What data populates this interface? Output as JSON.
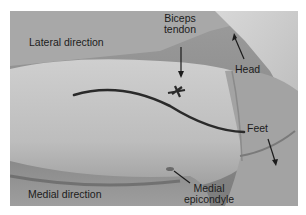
{
  "figure": {
    "labels": {
      "lateral_direction": "Lateral direction",
      "biceps_tendon_line1": "Biceps",
      "biceps_tendon_line2": "tendon",
      "head": "Head",
      "feet": "Feet",
      "medial_direction": "Medial direction",
      "medial_epicondyle_line1": "Medial",
      "medial_epicondyle_line2": "epicondyle"
    },
    "colors": {
      "background": "#ffffff",
      "text": "#1c1c1c",
      "marker_line": "#2a2a2a"
    }
  }
}
